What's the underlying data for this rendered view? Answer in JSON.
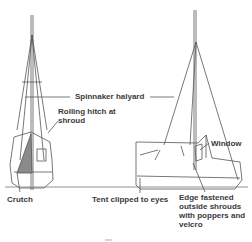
{
  "diagram": {
    "type": "technical line illustration",
    "colors": {
      "line": "#555555",
      "text": "#3a3a3a",
      "shade": "#8a8a8a",
      "background": "#ffffff"
    },
    "views": [
      {
        "name": "end-view",
        "description": "Mast with shrouds, tent hung from spinnaker halyard, crutch and window"
      },
      {
        "name": "side-view",
        "description": "Mast with shrouds, box-shaped tent over hull, window near mast"
      }
    ],
    "labels": {
      "spinnaker_halyard": "Spinnaker halyard",
      "rolling_hitch": "Rolling hitch at\nshroud",
      "window": "Window",
      "crutch": "Crutch",
      "tent_clipped": "Tent clipped to eyes",
      "edge_fastened": "Edge fastened\noutside shrouds\nwith poppers and\nvelcro"
    }
  }
}
